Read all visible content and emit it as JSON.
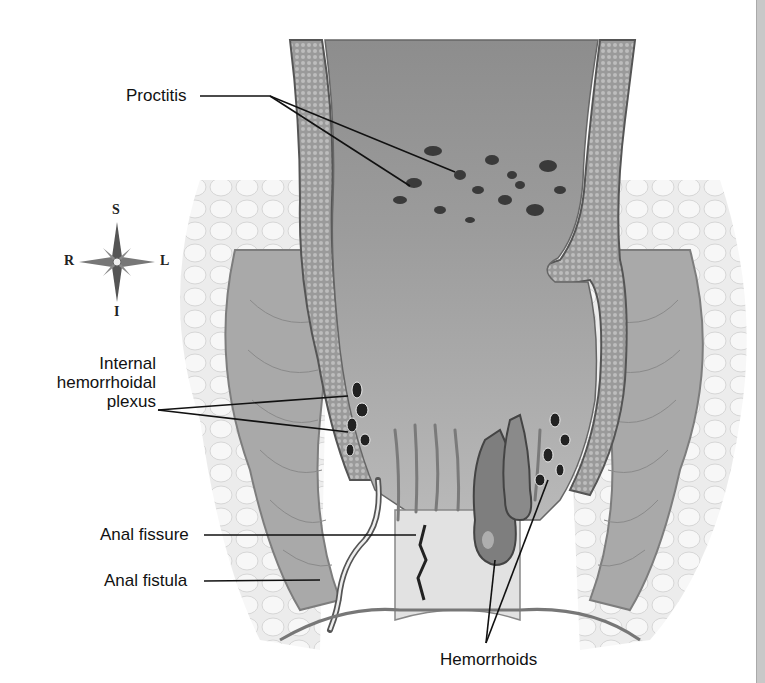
{
  "figure": {
    "labels": {
      "proctitis": "Proctitis",
      "internal_plexus_line1": "Internal",
      "internal_plexus_line2": "hemorrhoidal",
      "internal_plexus_line3": "plexus",
      "anal_fissure": "Anal fissure",
      "anal_fistula": "Anal fistula",
      "hemorrhoids": "Hemorrhoids"
    },
    "compass": {
      "superior": "S",
      "inferior": "I",
      "right": "R",
      "left": "L"
    },
    "colors": {
      "background": "#ffffff",
      "tissue_dark": "#6e6e6e",
      "tissue_mid": "#9a9a9a",
      "tissue_light": "#cfcfcf",
      "fat": "#e4e4e4",
      "leader_line": "#111111"
    }
  }
}
